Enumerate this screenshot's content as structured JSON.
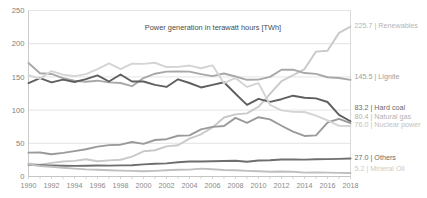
{
  "chart_data": {
    "type": "line",
    "title": "Power generation in terawatt hours [TWh]",
    "xlabel": "",
    "ylabel": "",
    "xlim": [
      1990,
      2018
    ],
    "ylim": [
      0,
      250
    ],
    "grid": true,
    "legend_position": "right-inline-end-labels",
    "x": [
      1990,
      1991,
      1992,
      1993,
      1994,
      1995,
      1996,
      1997,
      1998,
      1999,
      2000,
      2001,
      2002,
      2003,
      2004,
      2005,
      2006,
      2007,
      2008,
      2009,
      2010,
      2011,
      2012,
      2013,
      2014,
      2015,
      2016,
      2017,
      2018
    ],
    "x_tick_labels": [
      "1990",
      "1992",
      "1994",
      "1996",
      "1998",
      "2000",
      "2002",
      "2004",
      "2006",
      "2008",
      "2010",
      "2012",
      "2014",
      "2016",
      "2018"
    ],
    "y_tick_labels": [
      "0",
      "50",
      "100",
      "150",
      "200",
      "250"
    ],
    "y_ticks": [
      0,
      50,
      100,
      150,
      200,
      250
    ],
    "series": [
      {
        "name": "Renewables",
        "color": "#c9c9c9",
        "end_value": "225.7",
        "end_label": "225.7 | Renewables",
        "label_color": "#b5b5b5",
        "values": [
          19.7,
          17.7,
          20.5,
          22.5,
          23.6,
          26.0,
          22.9,
          24.3,
          25.2,
          29.9,
          38.0,
          39.5,
          45.4,
          47.0,
          57.1,
          63.6,
          73.9,
          88.8,
          93.6,
          95.1,
          105.0,
          124.6,
          143.7,
          152.5,
          161.8,
          188.1,
          189.4,
          216.3,
          225.7
        ]
      },
      {
        "name": "Lignite",
        "color": "#a8a8a8",
        "end_value": "145.5",
        "end_label": "145.5 | Lignite",
        "label_color": "#9e9e9e",
        "values": [
          170.9,
          155.6,
          154.4,
          148.0,
          144.3,
          142.6,
          144.3,
          141.7,
          140.8,
          136.0,
          148.3,
          154.8,
          158.0,
          158.2,
          158.0,
          154.1,
          151.1,
          155.1,
          150.6,
          145.6,
          145.9,
          150.1,
          160.7,
          160.9,
          155.8,
          154.5,
          149.5,
          148.4,
          145.5
        ]
      },
      {
        "name": "Hard coal",
        "color": "#5f5f5f",
        "end_value": "83.2",
        "end_label": "83.2 | Hard coal",
        "label_color": "#6b6b6b",
        "values": [
          140.8,
          148.2,
          141.7,
          145.8,
          142.3,
          146.6,
          152.2,
          143.1,
          153.6,
          143.1,
          143.1,
          137.9,
          134.9,
          146.4,
          140.8,
          134.1,
          137.9,
          142.0,
          124.6,
          107.9,
          117.0,
          112.4,
          116.4,
          121.7,
          118.6,
          117.7,
          112.2,
          92.9,
          83.2
        ]
      },
      {
        "name": "Natural gas",
        "color": "#9a9a9a",
        "end_value": "80.4",
        "end_label": "80.4 | Natural gas",
        "label_color": "#b2b2b2",
        "values": [
          35.9,
          36.1,
          33.6,
          35.5,
          38.3,
          41.1,
          45.0,
          47.2,
          47.9,
          52.0,
          49.2,
          55.0,
          56.2,
          61.4,
          62.0,
          71.0,
          74.7,
          76.0,
          88.3,
          80.9,
          89.3,
          86.0,
          76.4,
          67.5,
          61.1,
          62.0,
          81.3,
          86.7,
          80.4
        ]
      },
      {
        "name": "Nuclear power",
        "color": "#d4d4d4",
        "end_value": "76.0",
        "end_label": "76.0 | Nuclear power",
        "label_color": "#c2c2c2",
        "values": [
          152.5,
          147.4,
          158.8,
          153.5,
          151.2,
          154.1,
          161.6,
          170.3,
          161.6,
          170.0,
          169.6,
          171.3,
          164.8,
          165.1,
          167.1,
          163.0,
          167.4,
          140.5,
          148.5,
          134.9,
          140.6,
          108.0,
          99.5,
          97.3,
          97.1,
          91.8,
          84.6,
          76.3,
          76.0
        ]
      },
      {
        "name": "Others",
        "color": "#6e6e6e",
        "end_value": "27.0",
        "end_label": "27.0 | Others",
        "label_color": "#6b6b6b",
        "values": [
          17.5,
          17.1,
          16.5,
          16.2,
          16.0,
          16.2,
          16.6,
          16.4,
          16.7,
          17.0,
          18.3,
          19.3,
          19.8,
          21.5,
          22.7,
          22.5,
          23.0,
          23.3,
          23.7,
          22.3,
          24.0,
          24.5,
          25.5,
          25.8,
          25.4,
          25.9,
          26.2,
          26.6,
          27.0
        ]
      },
      {
        "name": "Mineral Oil",
        "color": "#bfbfbf",
        "end_value": "5.2",
        "end_label": "5.2 | Mineral Oil",
        "label_color": "#cbcbcb",
        "values": [
          18.4,
          15.8,
          14.6,
          13.2,
          11.8,
          10.7,
          10.1,
          9.5,
          8.9,
          8.4,
          7.9,
          8.5,
          9.4,
          10.2,
          10.3,
          11.8,
          11.0,
          9.7,
          9.3,
          8.5,
          8.0,
          7.2,
          7.6,
          7.2,
          5.9,
          6.2,
          5.8,
          5.5,
          5.2
        ]
      }
    ]
  }
}
